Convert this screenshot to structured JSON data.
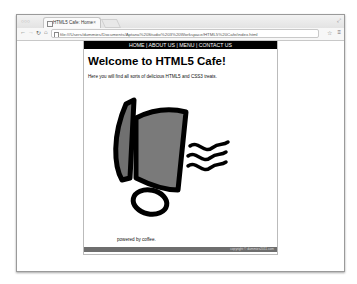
{
  "browser": {
    "tab_title": "HTML5 Cafe: Home",
    "tab_close": "×",
    "address": "file:///Users/dummies/Documents/Aptana%20Studio%203%20Workspace/HTML5%20Cafe/index.html",
    "icons": {
      "back": "←",
      "forward": "→",
      "reload": "↻",
      "home": "⌂",
      "star": "☆",
      "menu": "≡",
      "traffic": "○○○",
      "resize": "⤢"
    }
  },
  "page": {
    "nav": [
      "HOME",
      "ABOUT US",
      "MENU",
      "CONTACT US"
    ],
    "nav_separator": " | ",
    "heading": "Welcome to HTML5 Cafe!",
    "intro": "Here you will find all sorts of delicious HTML5 and CSS3 treats.",
    "powered": "powered by coffee.",
    "footer": "copyright © dummies2011.com",
    "image_alt": "coffee cup",
    "colors": {
      "nav_bg": "#000000",
      "footer_bg": "#6e6e6e",
      "cup_fill": "#777777"
    }
  }
}
